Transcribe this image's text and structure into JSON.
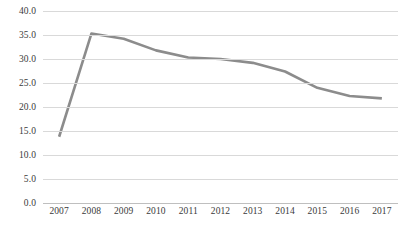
{
  "chart_data": {
    "type": "line",
    "title": "",
    "subtitle": "",
    "xlabel": "",
    "ylabel": "",
    "categories": [
      "2007",
      "2008",
      "2009",
      "2010",
      "2011",
      "2012",
      "2013",
      "2014",
      "2015",
      "2016",
      "2017"
    ],
    "series": [
      {
        "name": "Series 1",
        "color": "#8c8c8c",
        "values": [
          13.8,
          35.3,
          34.2,
          31.8,
          30.3,
          30.0,
          29.2,
          27.4,
          24.0,
          22.3,
          21.8
        ]
      }
    ],
    "ylim": [
      0.0,
      40.0
    ],
    "ytick_step": 5.0,
    "ytick_labels": [
      "0.0",
      "5.0",
      "10.0",
      "15.0",
      "20.0",
      "25.0",
      "30.0",
      "35.0",
      "40.0"
    ],
    "ytick_values": [
      0.0,
      5.0,
      10.0,
      15.0,
      20.0,
      25.0,
      30.0,
      35.0,
      40.0
    ],
    "grid": true,
    "grid_color": "#d9d9d9",
    "legend": false,
    "legend_position": "none",
    "markers": false,
    "background": "#ffffff"
  }
}
